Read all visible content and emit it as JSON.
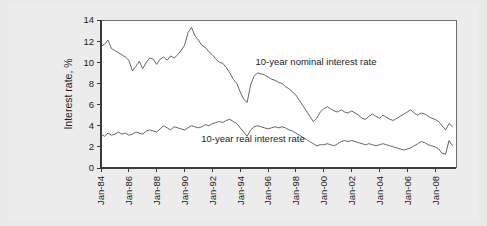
{
  "chart_data": {
    "type": "line",
    "title": "",
    "xlabel": "",
    "ylabel": "Interest rate, %",
    "ylim": [
      0,
      14
    ],
    "ytick_values": [
      0,
      2,
      4,
      6,
      8,
      10,
      12,
      14
    ],
    "ytick_labels": [
      "0",
      "2",
      "4",
      "6",
      "8",
      "10",
      "12",
      "14"
    ],
    "xtick_labels": [
      "Jan-84",
      "Jan-86",
      "Jan-88",
      "Jan-90",
      "Jan-92",
      "Jan-94",
      "Jan-96",
      "Jan-98",
      "Jan-00",
      "Jan-02",
      "Jan-04",
      "Jan-06",
      "Jan-08"
    ],
    "xlim": [
      1984.0,
      2009.5
    ],
    "grid": false,
    "legend_position": "inline-annotation",
    "annotations": [
      {
        "text": "10-year nominal interest rate",
        "x": 1995.1,
        "y": 9.75
      },
      {
        "text": "10-year real interest rate",
        "x": 1991.2,
        "y": 2.45
      }
    ],
    "series": [
      {
        "name": "10-year nominal interest rate",
        "color": "#4a4a4a",
        "x": [
          1984.0,
          1984.25,
          1984.5,
          1984.75,
          1985.0,
          1985.25,
          1985.5,
          1985.75,
          1986.0,
          1986.25,
          1986.5,
          1986.75,
          1987.0,
          1987.25,
          1987.5,
          1987.75,
          1988.0,
          1988.25,
          1988.5,
          1988.75,
          1989.0,
          1989.25,
          1989.5,
          1989.75,
          1990.0,
          1990.25,
          1990.5,
          1990.75,
          1991.0,
          1991.25,
          1991.5,
          1991.75,
          1992.0,
          1992.25,
          1992.5,
          1992.75,
          1993.0,
          1993.25,
          1993.5,
          1993.75,
          1994.0,
          1994.25,
          1994.5,
          1994.75,
          1995.0,
          1995.25,
          1995.5,
          1995.75,
          1996.0,
          1996.25,
          1996.5,
          1996.75,
          1997.0,
          1997.25,
          1997.5,
          1997.75,
          1998.0,
          1998.25,
          1998.5,
          1998.75,
          1999.0,
          1999.25,
          1999.5,
          1999.75,
          2000.0,
          2000.25,
          2000.5,
          2000.75,
          2001.0,
          2001.25,
          2001.5,
          2001.75,
          2002.0,
          2002.25,
          2002.5,
          2002.75,
          2003.0,
          2003.25,
          2003.5,
          2003.75,
          2004.0,
          2004.25,
          2004.5,
          2004.75,
          2005.0,
          2005.25,
          2005.5,
          2005.75,
          2006.0,
          2006.25,
          2006.5,
          2006.75,
          2007.0,
          2007.25,
          2007.5,
          2007.75,
          2008.0,
          2008.25,
          2008.5,
          2008.75,
          2009.0,
          2009.25
        ],
        "values": [
          11.5,
          11.7,
          12.1,
          11.3,
          11.1,
          10.9,
          10.7,
          10.5,
          10.2,
          9.2,
          9.6,
          10.1,
          9.4,
          10.0,
          10.4,
          10.3,
          9.8,
          10.3,
          10.5,
          10.2,
          10.6,
          10.4,
          10.7,
          11.1,
          11.6,
          12.8,
          13.3,
          12.5,
          12.1,
          11.6,
          11.4,
          11.0,
          10.7,
          10.3,
          10.0,
          9.9,
          9.5,
          9.0,
          8.4,
          8.0,
          7.2,
          6.5,
          6.2,
          7.9,
          8.7,
          9.0,
          8.9,
          8.8,
          8.6,
          8.4,
          8.3,
          8.1,
          8.0,
          7.7,
          7.5,
          7.2,
          6.9,
          6.4,
          5.9,
          5.4,
          4.9,
          4.4,
          4.7,
          5.3,
          5.6,
          5.8,
          5.6,
          5.4,
          5.3,
          5.5,
          5.3,
          5.2,
          5.4,
          5.2,
          5.0,
          4.7,
          4.6,
          4.9,
          5.1,
          4.9,
          4.7,
          5.0,
          4.8,
          4.6,
          4.5,
          4.7,
          4.9,
          5.1,
          5.3,
          5.5,
          5.2,
          5.0,
          5.2,
          5.1,
          4.9,
          4.7,
          4.6,
          4.4,
          4.0,
          3.6,
          4.2,
          3.9
        ]
      },
      {
        "name": "10-year real interest rate",
        "color": "#4a4a4a",
        "x": [
          1984.0,
          1984.25,
          1984.5,
          1984.75,
          1985.0,
          1985.25,
          1985.5,
          1985.75,
          1986.0,
          1986.25,
          1986.5,
          1986.75,
          1987.0,
          1987.25,
          1987.5,
          1987.75,
          1988.0,
          1988.25,
          1988.5,
          1988.75,
          1989.0,
          1989.25,
          1989.5,
          1989.75,
          1990.0,
          1990.25,
          1990.5,
          1990.75,
          1991.0,
          1991.25,
          1991.5,
          1991.75,
          1992.0,
          1992.25,
          1992.5,
          1992.75,
          1993.0,
          1993.25,
          1993.5,
          1993.75,
          1994.0,
          1994.25,
          1994.5,
          1994.75,
          1995.0,
          1995.25,
          1995.5,
          1995.75,
          1996.0,
          1996.25,
          1996.5,
          1996.75,
          1997.0,
          1997.25,
          1997.5,
          1997.75,
          1998.0,
          1998.25,
          1998.5,
          1998.75,
          1999.0,
          1999.25,
          1999.5,
          1999.75,
          2000.0,
          2000.25,
          2000.5,
          2000.75,
          2001.0,
          2001.25,
          2001.5,
          2001.75,
          2002.0,
          2002.25,
          2002.5,
          2002.75,
          2003.0,
          2003.25,
          2003.5,
          2003.75,
          2004.0,
          2004.25,
          2004.5,
          2004.75,
          2005.0,
          2005.25,
          2005.5,
          2005.75,
          2006.0,
          2006.25,
          2006.5,
          2006.75,
          2007.0,
          2007.25,
          2007.5,
          2007.75,
          2008.0,
          2008.25,
          2008.5,
          2008.75,
          2009.0,
          2009.25
        ],
        "values": [
          3.2,
          3.0,
          3.3,
          3.1,
          3.2,
          3.4,
          3.2,
          3.3,
          3.1,
          3.2,
          3.4,
          3.3,
          3.2,
          3.5,
          3.6,
          3.5,
          3.4,
          3.7,
          4.0,
          3.8,
          3.6,
          3.9,
          3.8,
          3.7,
          3.6,
          3.8,
          4.0,
          3.9,
          3.8,
          3.9,
          4.1,
          4.0,
          4.2,
          4.3,
          4.4,
          4.3,
          4.5,
          4.6,
          4.4,
          4.2,
          3.8,
          3.4,
          3.0,
          3.6,
          3.9,
          4.0,
          3.9,
          3.8,
          3.7,
          3.8,
          3.9,
          3.8,
          3.9,
          3.8,
          3.6,
          3.5,
          3.3,
          3.1,
          2.9,
          2.7,
          2.5,
          2.3,
          2.1,
          2.2,
          2.2,
          2.3,
          2.2,
          2.1,
          2.3,
          2.5,
          2.6,
          2.5,
          2.6,
          2.5,
          2.4,
          2.3,
          2.2,
          2.3,
          2.2,
          2.1,
          2.2,
          2.3,
          2.2,
          2.1,
          2.0,
          1.9,
          1.8,
          1.7,
          1.8,
          1.9,
          2.1,
          2.3,
          2.5,
          2.4,
          2.2,
          2.1,
          2.0,
          1.8,
          1.4,
          1.3,
          2.6,
          2.1
        ]
      }
    ]
  }
}
